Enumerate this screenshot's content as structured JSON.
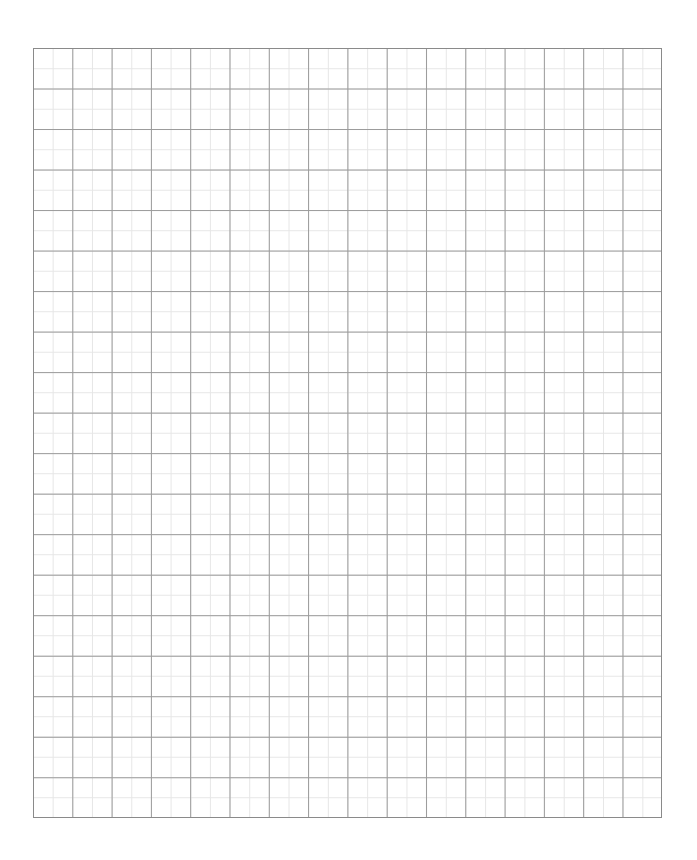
{
  "page": {
    "type": "grid-paper",
    "grid": {
      "columns": 16,
      "rows": 19,
      "minor_subdivisions": 2,
      "major_line_color": "#9a9a9a",
      "minor_line_color": "#e6e6e6",
      "border_color": "#8a8a8a",
      "background_color": "#ffffff"
    }
  }
}
